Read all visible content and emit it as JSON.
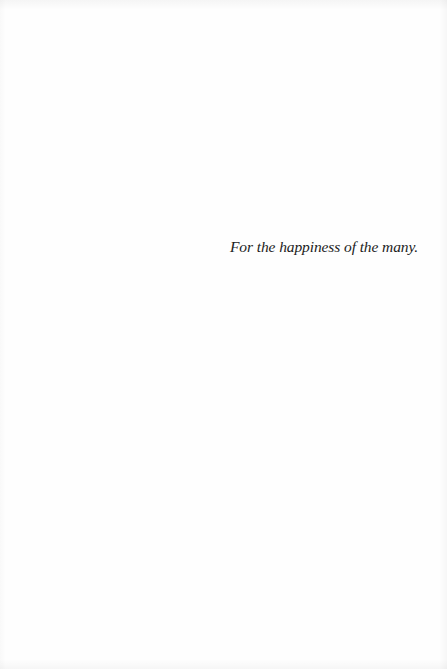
{
  "page": {
    "type": "dedication",
    "dedication_text": "For the happiness of the many.",
    "text_color": "#1c1c1c",
    "background_color": "#fefefe"
  }
}
